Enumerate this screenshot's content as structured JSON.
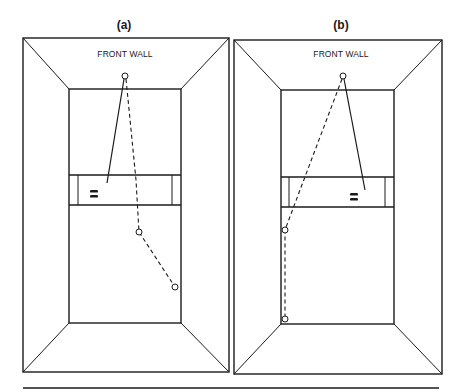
{
  "colors": {
    "ink": "#1a1a1a",
    "paper": "#ffffff"
  },
  "panels": [
    {
      "id": "a",
      "label": "(a)",
      "label_pos": [
        124,
        20
      ],
      "wall_label": "FRONT WALL",
      "wall_label_pos": [
        125,
        49
      ],
      "outer": [
        23,
        38,
        229,
        372
      ],
      "inner": [
        69,
        89,
        181,
        323
      ],
      "service_zone": {
        "top": 175,
        "bottom": 205,
        "left_line": 78,
        "right_line": 172
      },
      "front_wall_ball": [
        125,
        76
      ],
      "shot_line": [
        [
          124,
          79
        ],
        [
          107,
          183
        ]
      ],
      "ball_path": [
        [
          126,
          79
        ],
        [
          136,
          180
        ],
        [
          139,
          232
        ],
        [
          175,
          287
        ]
      ],
      "bounce_points": [
        [
          139,
          232
        ],
        [
          175,
          287
        ]
      ],
      "player_mark": [
        94,
        194
      ]
    },
    {
      "id": "b",
      "label": "(b)",
      "label_pos": [
        341,
        20
      ],
      "wall_label": "FRONT WALL",
      "wall_label_pos": [
        341,
        49
      ],
      "outer": [
        234,
        40,
        442,
        374
      ],
      "inner": [
        281,
        90,
        394,
        324
      ],
      "service_zone": {
        "top": 177,
        "bottom": 207,
        "left_line": 289,
        "right_line": 385
      },
      "front_wall_ball": [
        343,
        76
      ],
      "shot_line": [
        [
          344,
          79
        ],
        [
          365,
          190
        ]
      ],
      "ball_path": [
        [
          342,
          79
        ],
        [
          300,
          190
        ],
        [
          285,
          230
        ],
        [
          285,
          319
        ]
      ],
      "bounce_points": [
        [
          285,
          230
        ],
        [
          285,
          319
        ]
      ],
      "player_mark": [
        354,
        197
      ]
    }
  ],
  "rule": [
    23,
    388,
    439,
    388
  ]
}
